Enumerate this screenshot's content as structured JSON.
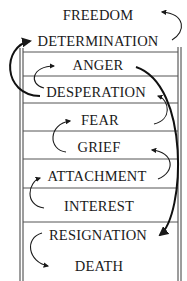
{
  "diagram": {
    "title": "",
    "type": "emotional ladder",
    "colors": {
      "ink": "#1a1a1a",
      "background": "#ffffff"
    },
    "levels": [
      {
        "label": "FREEDOM",
        "y": 20
      },
      {
        "label": "DETERMINATION",
        "y": 46
      },
      {
        "label": "ANGER",
        "y": 70
      },
      {
        "label": "DESPERATION",
        "y": 97
      },
      {
        "label": "FEAR",
        "y": 125
      },
      {
        "label": "GRIEF",
        "y": 152
      },
      {
        "label": "ATTACHMENT",
        "y": 181
      },
      {
        "label": "INTEREST",
        "y": 211
      },
      {
        "label": "RESIGNATION",
        "y": 240
      },
      {
        "label": "DEATH",
        "y": 271
      }
    ],
    "connections": [
      {
        "from": "DETERMINATION",
        "to": "FREEDOM"
      },
      {
        "from": "DESPERATION",
        "to": "DETERMINATION"
      },
      {
        "from": "DESPERATION",
        "to": "ANGER"
      },
      {
        "from": "ANGER",
        "to": "RESIGNATION"
      },
      {
        "from": "FEAR",
        "to": "DESPERATION"
      },
      {
        "from": "GRIEF",
        "to": "FEAR"
      },
      {
        "from": "ATTACHMENT",
        "to": "GRIEF"
      },
      {
        "from": "INTEREST",
        "to": "ATTACHMENT"
      },
      {
        "from": "RESIGNATION",
        "to": "DEATH"
      }
    ]
  }
}
